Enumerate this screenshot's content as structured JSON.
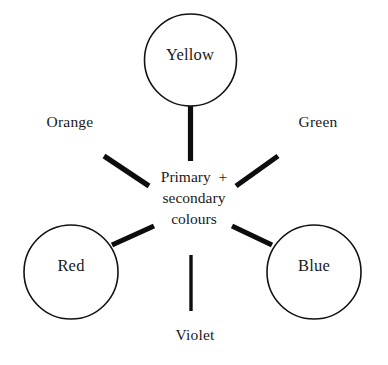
{
  "diagram": {
    "background_color": "#ffffff",
    "stroke_color": "#121212",
    "center": {
      "line1": "Primary  +",
      "line2": "secondary",
      "line3": "colours"
    },
    "nodes": [
      {
        "id": "yellow",
        "label": "Yellow",
        "position": "top",
        "shape": "circle"
      },
      {
        "id": "red",
        "label": "Red",
        "position": "bottom-left",
        "shape": "circle"
      },
      {
        "id": "blue",
        "label": "Blue",
        "position": "bottom-right",
        "shape": "circle"
      }
    ],
    "outer_labels": [
      {
        "id": "orange",
        "label": "Orange",
        "position": "upper-left"
      },
      {
        "id": "green",
        "label": "Green",
        "position": "upper-right"
      },
      {
        "id": "violet",
        "label": "Violet",
        "position": "bottom"
      }
    ],
    "connectors": [
      {
        "id": "yellow-spoke",
        "from": "yellow",
        "to": "center",
        "style": "thick-vertical"
      },
      {
        "id": "red-spoke",
        "from": "red",
        "to": "center",
        "style": "thick-diagonal"
      },
      {
        "id": "blue-spoke",
        "from": "blue",
        "to": "center",
        "style": "thick-diagonal"
      },
      {
        "id": "orange-spoke",
        "from": "center",
        "to": "orange",
        "style": "thick-diagonal"
      },
      {
        "id": "green-spoke",
        "from": "center",
        "to": "green",
        "style": "thick-diagonal"
      },
      {
        "id": "violet-spoke",
        "from": "center",
        "to": "violet",
        "style": "thin-vertical"
      }
    ]
  }
}
